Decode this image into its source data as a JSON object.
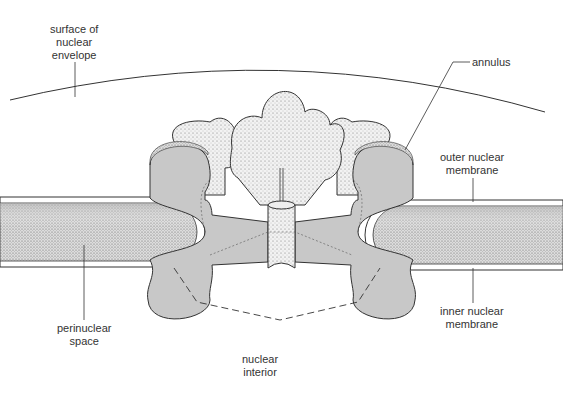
{
  "labels": {
    "surface": {
      "line1": "surface of",
      "line2": "nuclear",
      "line3": "envelope"
    },
    "annulus": {
      "line1": "annulus"
    },
    "outer_membrane": {
      "line1": "outer nuclear",
      "line2": "membrane"
    },
    "inner_membrane": {
      "line1": "inner nuclear",
      "line2": "membrane"
    },
    "perinuclear": {
      "line1": "perinuclear",
      "line2": "space"
    },
    "interior": {
      "line1": "nuclear",
      "line2": "interior"
    }
  },
  "colors": {
    "line": "#333333",
    "pore_gray": "#c8c8c8",
    "stipple": "#8a8a8a",
    "background": "#ffffff"
  }
}
